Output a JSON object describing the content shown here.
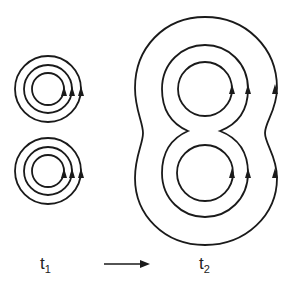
{
  "diagram": {
    "labels": {
      "t1": {
        "base": "t",
        "sub": "1"
      },
      "t2": {
        "base": "t",
        "sub": "2"
      }
    },
    "arrow": "time-arrow",
    "stroke_color": "#1a1a1a",
    "left_groups": [
      {
        "cx": 48,
        "cy": 89,
        "radii": [
          16,
          24,
          33
        ]
      },
      {
        "cx": 48,
        "cy": 171,
        "radii": [
          16,
          24,
          33
        ]
      }
    ],
    "right_inner": [
      {
        "cx": 205,
        "cy": 89,
        "r": 27
      },
      {
        "cx": 205,
        "cy": 173,
        "r": 28
      }
    ]
  }
}
